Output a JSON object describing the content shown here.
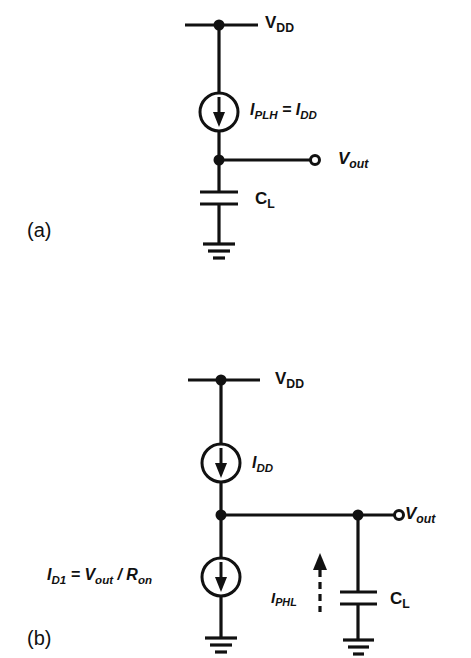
{
  "figure": {
    "panel_a": {
      "label": "(a)",
      "vdd": {
        "main": "V",
        "sub": "DD"
      },
      "current_source": {
        "main": "I",
        "sub": "PLH",
        "eq": " = ",
        "main2": "I",
        "sub2": "DD"
      },
      "output": {
        "main": "V",
        "sub": "out"
      },
      "capacitor": {
        "main": "C",
        "sub": "L"
      }
    },
    "panel_b": {
      "label": "(b)",
      "vdd": {
        "main": "V",
        "sub": "DD"
      },
      "current_source_top": {
        "main": "I",
        "sub": "DD"
      },
      "current_source_bottom": {
        "main": "I",
        "sub": "D1",
        "eq": " = ",
        "main2": "V",
        "sub2": "out",
        "slash": " / ",
        "main3": "R",
        "sub3": "on"
      },
      "discharge_current": {
        "main": "I",
        "sub": "PHL"
      },
      "output": {
        "main": "V",
        "sub": "out"
      },
      "capacitor": {
        "main": "C",
        "sub": "L"
      }
    },
    "colors": {
      "ink": "#111111",
      "background": "#ffffff"
    }
  }
}
